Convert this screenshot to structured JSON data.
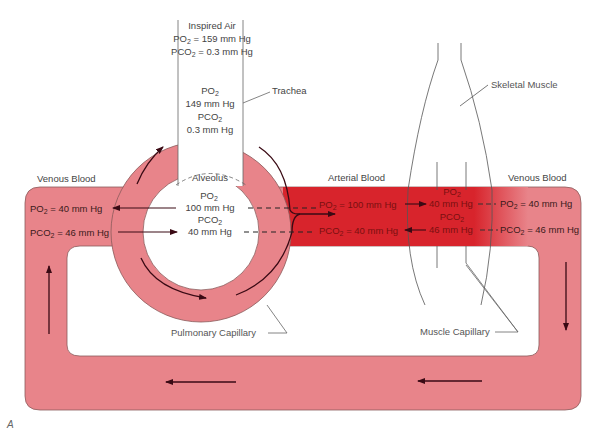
{
  "figure_label": "A",
  "colors": {
    "venous": "#e8848a",
    "arterial": "#d8242c",
    "outline": "#7a4a4a",
    "arrow": "#3a0a14",
    "text": "#444444"
  },
  "inspired_air": {
    "title": "Inspired Air",
    "po2": "PO2 = 159 mm Hg",
    "po2_prefix": "PO",
    "po2_sub": "2",
    "po2_value": " = 159 mm Hg",
    "pco2_prefix": "PCO",
    "pco2_sub": "2",
    "pco2_value": " = 0.3 mm Hg"
  },
  "trachea": {
    "label": "Trachea",
    "po2_prefix": "PO",
    "po2_sub": "2",
    "po2_value": "149 mm Hg",
    "pco2_prefix": "PCO",
    "pco2_sub": "2",
    "pco2_value": "0.3 mm Hg"
  },
  "alveolus": {
    "label": "Alveolus",
    "po2_prefix": "PO",
    "po2_sub": "2",
    "po2_value": "100 mm Hg",
    "pco2_prefix": "PCO",
    "pco2_sub": "2",
    "pco2_value": "40 mm Hg"
  },
  "venous_blood_left": {
    "label": "Venous Blood",
    "po2_prefix": "PO",
    "po2_sub": "2",
    "po2_value": " = 40 mm Hg",
    "pco2_prefix": "PCO",
    "pco2_sub": "2",
    "pco2_value": " = 46 mm Hg"
  },
  "arterial_blood": {
    "label": "Arterial Blood",
    "po2_prefix": "PO",
    "po2_sub": "2",
    "po2_value": " = 100 mm Hg",
    "pco2_prefix": "PCO",
    "pco2_sub": "2",
    "pco2_value": " = 40 mm Hg"
  },
  "muscle_tissue": {
    "po2_prefix": "PO",
    "po2_sub": "2",
    "po2_value": "40 mm Hg",
    "pco2_prefix": "PCO",
    "pco2_sub": "2",
    "pco2_value": "46 mm Hg"
  },
  "venous_blood_right": {
    "label": "Venous Blood",
    "po2_prefix": "PO",
    "po2_sub": "2",
    "po2_value": " = 40 mm Hg",
    "pco2_prefix": "PCO",
    "pco2_sub": "2",
    "pco2_value": " = 46 mm Hg"
  },
  "labels": {
    "skeletal_muscle": "Skeletal Muscle",
    "pulmonary_capillary": "Pulmonary Capillary",
    "muscle_capillary": "Muscle Capillary"
  }
}
